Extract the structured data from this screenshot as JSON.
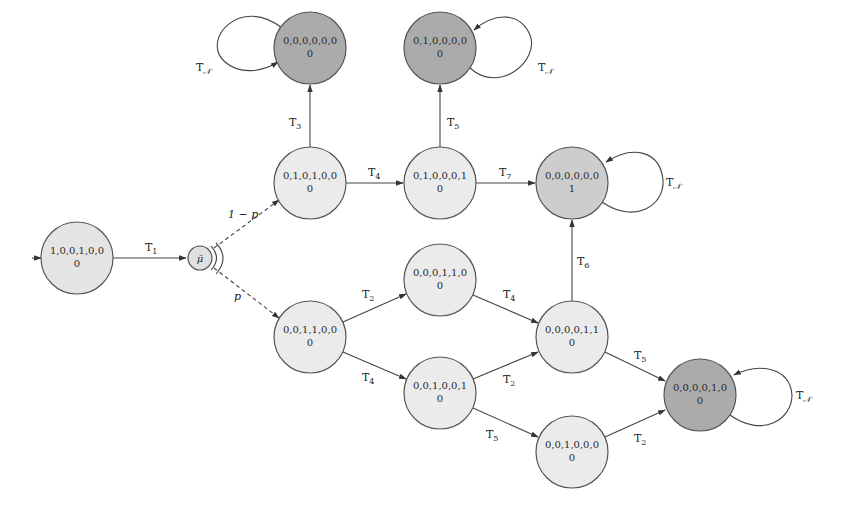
{
  "diagram": {
    "type": "state-transition",
    "colors": {
      "light_node": "#e8e8e8",
      "medium_node": "#cdcdcd",
      "dark_node": "#a9a9a9",
      "stroke": "#444444"
    },
    "nodes": [
      {
        "id": "A",
        "state": "1,0,0,1,0,0",
        "value": "0",
        "shade": "light",
        "initial": true
      },
      {
        "id": "MU",
        "state": "μ̄",
        "value": "",
        "shade": "light",
        "probabilistic": true
      },
      {
        "id": "B",
        "state": "0,1,0,1,0,0",
        "value": "0",
        "shade": "light"
      },
      {
        "id": "C",
        "state": "0,0,0,0,0,0",
        "value": "0",
        "shade": "dark"
      },
      {
        "id": "D",
        "state": "0,1,0,0,0,1",
        "value": "0",
        "shade": "light"
      },
      {
        "id": "E",
        "state": "0,1,0,0,0,0",
        "value": "0",
        "shade": "dark"
      },
      {
        "id": "F",
        "state": "0,0,0,0,0,0",
        "value": "1",
        "shade": "medium"
      },
      {
        "id": "G",
        "state": "0,0,1,1,0,0",
        "value": "0",
        "shade": "light"
      },
      {
        "id": "H",
        "state": "0,0,0,1,1,0",
        "value": "0",
        "shade": "light"
      },
      {
        "id": "I",
        "state": "0,0,1,0,0,1",
        "value": "0",
        "shade": "light"
      },
      {
        "id": "J",
        "state": "0,0,0,0,1,1",
        "value": "0",
        "shade": "light"
      },
      {
        "id": "K",
        "state": "0,0,1,0,0,0",
        "value": "0",
        "shade": "light"
      },
      {
        "id": "L",
        "state": "0,0,0,0,1,0",
        "value": "0",
        "shade": "dark"
      }
    ],
    "edges": [
      {
        "from": "A",
        "to": "MU",
        "label": "T",
        "sub": "1"
      },
      {
        "from": "MU",
        "to": "B",
        "label": "1 − p",
        "sub": "",
        "dashed": true
      },
      {
        "from": "MU",
        "to": "G",
        "label": "p",
        "sub": "",
        "dashed": true
      },
      {
        "from": "B",
        "to": "C",
        "label": "T",
        "sub": "3"
      },
      {
        "from": "B",
        "to": "D",
        "label": "T",
        "sub": "4"
      },
      {
        "from": "D",
        "to": "E",
        "label": "T",
        "sub": "5"
      },
      {
        "from": "D",
        "to": "F",
        "label": "T",
        "sub": "7"
      },
      {
        "from": "G",
        "to": "H",
        "label": "T",
        "sub": "2"
      },
      {
        "from": "G",
        "to": "I",
        "label": "T",
        "sub": "4"
      },
      {
        "from": "H",
        "to": "J",
        "label": "T",
        "sub": "4"
      },
      {
        "from": "I",
        "to": "J",
        "label": "T",
        "sub": "2"
      },
      {
        "from": "I",
        "to": "K",
        "label": "T",
        "sub": "5"
      },
      {
        "from": "J",
        "to": "F",
        "label": "T",
        "sub": "6"
      },
      {
        "from": "J",
        "to": "L",
        "label": "T",
        "sub": "5"
      },
      {
        "from": "K",
        "to": "L",
        "label": "T",
        "sub": "2"
      },
      {
        "from": "C",
        "to": "C",
        "label": "T",
        "sub": "𝒩",
        "self_loop": true
      },
      {
        "from": "E",
        "to": "E",
        "label": "T",
        "sub": "𝒩",
        "self_loop": true
      },
      {
        "from": "F",
        "to": "F",
        "label": "T",
        "sub": "𝒩",
        "self_loop": true
      },
      {
        "from": "L",
        "to": "L",
        "label": "T",
        "sub": "𝒩",
        "self_loop": true
      }
    ]
  }
}
